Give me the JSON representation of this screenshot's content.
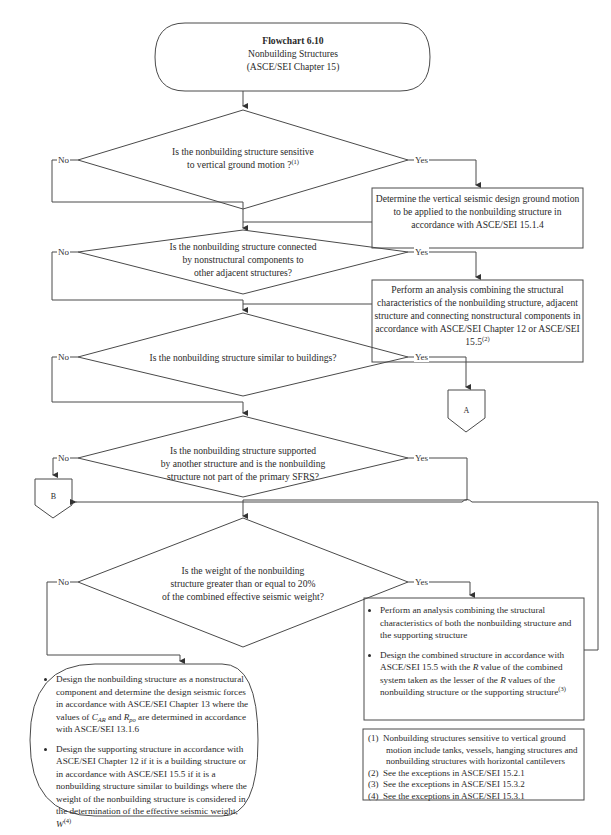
{
  "start": {
    "title": "Flowchart 6.10",
    "subtitle": "Nonbuilding Structures",
    "reference": "(ASCE/SEI Chapter 15)"
  },
  "decisions": [
    {
      "id": "d1",
      "line1": "Is the nonbuilding structure sensitive",
      "line2": "to vertical ground motion ?",
      "sup": "(1)",
      "no_label": "No",
      "yes_label": "Yes"
    },
    {
      "id": "d2",
      "line1": "Is the nonbuilding structure connected",
      "line2": "by nonstructural components to",
      "line3": "other adjacent structures?",
      "no_label": "No",
      "yes_label": "Yes"
    },
    {
      "id": "d3",
      "line1": "Is the nonbuilding structure similar to buildings?",
      "no_label": "No",
      "yes_label": "Yes"
    },
    {
      "id": "d4",
      "line1": "Is the nonbuilding structure supported",
      "line2": "by another structure and is the nonbuilding",
      "line3": "structure not part of the primary SFRS?",
      "no_label": "No",
      "yes_label": "Yes"
    },
    {
      "id": "d5",
      "line1": "Is the weight of the nonbuilding",
      "line2": "structure greater than or equal to 20%",
      "line3": "of the combined effective seismic weight?",
      "no_label": "No",
      "yes_label": "Yes"
    }
  ],
  "processes": {
    "p1": {
      "text": "Determine the vertical seismic design ground motion to be applied to the nonbuilding structure in accordance with ASCE/SEI 15.1.4"
    },
    "p2": {
      "text": "Perform an analysis combining the structural characteristics of the nonbuilding structure, adjacent structure and connecting nonstructural components in accordance with ASCE/SEI Chapter 12 or ASCE/SEI 15.5",
      "sup": "(2)"
    },
    "p3": {
      "bullet1": "Perform an analysis combining the structural characteristics of both the nonbuilding structure and the supporting structure",
      "bullet2_a": "Design the combined structure in accordance with ASCE/SEI 15.5 with the ",
      "bullet2_r1": "R",
      "bullet2_b": " value of the combined system taken as the lesser of the ",
      "bullet2_r2": "R",
      "bullet2_c": " values of the nonbuilding structure or the supporting structure",
      "bullet2_sup": "(3)"
    },
    "end": {
      "bullet1_a": "Design the nonbuilding structure as a nonstructural component and determine the design seismic forces in accordance with ASCE/SEI Chapter 13 where the values of ",
      "bullet1_c": "C",
      "bullet1_c_sub": "AR",
      "bullet1_and": " and ",
      "bullet1_r": "R",
      "bullet1_r_sub": "po",
      "bullet1_b": " are determined in accordance with ASCE/SEI 13.1.6",
      "bullet2_a": "Design the supporting structure in accordance with ASCE/SEI Chapter 12 if it is a building structure or in accordance with ASCE/SEI 15.5 if it is a nonbuilding structure similar to buildings where the weight of the nonbuilding structure is considered in the determination of the effective seismic weight, ",
      "bullet2_w": "W",
      "bullet2_sup": "(4)"
    }
  },
  "connectors": {
    "a": "A",
    "b": "B"
  },
  "footnotes": [
    {
      "num": "(1)",
      "text": "Nonbuilding structures sensitive to vertical ground motion include tanks, vessels, hanging structures and nonbuilding structures with horizontal cantilevers"
    },
    {
      "num": "(2)",
      "text": "See the exceptions in ASCE/SEI 15.2.1"
    },
    {
      "num": "(3)",
      "text": "See the exceptions in ASCE/SEI 15.3.2"
    },
    {
      "num": "(4)",
      "text": "See the exceptions in ASCE/SEI 15.3.1"
    }
  ],
  "colors": {
    "line": "#4a4a4a",
    "text": "#2a2a2a",
    "background": "#ffffff"
  }
}
